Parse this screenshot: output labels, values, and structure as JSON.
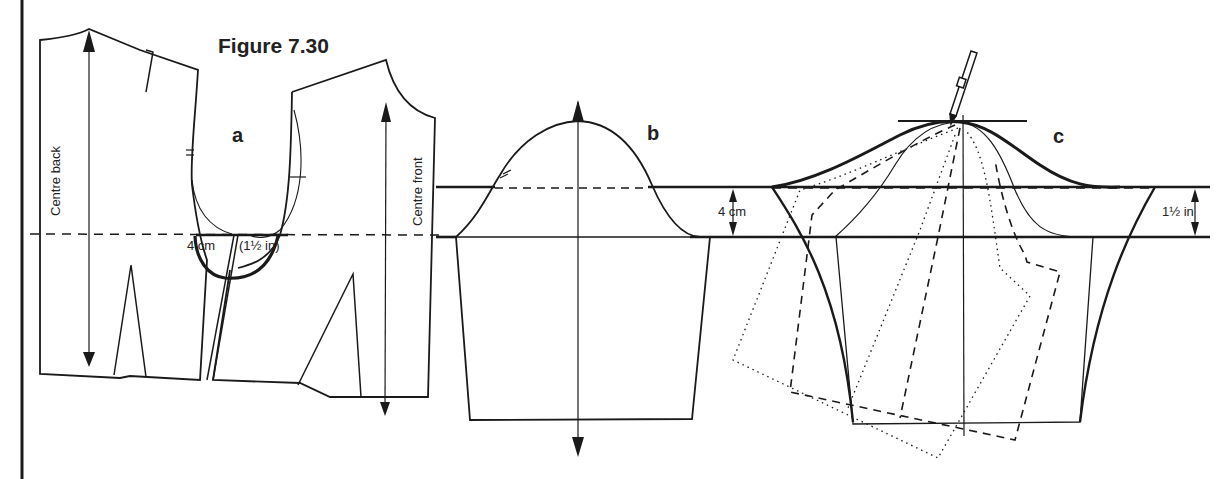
{
  "figure": {
    "title": "Figure 7.30",
    "panels": [
      {
        "id": "a",
        "label": "a",
        "description": "Back and front bodice with armhole lowered"
      },
      {
        "id": "b",
        "label": "b",
        "description": "Sleeve with crown raised"
      },
      {
        "id": "c",
        "label": "c",
        "description": "Sleeve slashed and spread, new crown drawn"
      }
    ]
  },
  "labels": {
    "centre_back": "Centre back",
    "centre_front": "Centre front",
    "armhole_lowering_cm": "4 cm",
    "armhole_lowering_in": "(1½ in)",
    "sleeve_b_measure": "4 cm",
    "sleeve_c_measure": "1½ in"
  },
  "colors": {
    "line": "#1a1a1a",
    "background": "#ffffff"
  },
  "icons": {
    "pencil": "pencil-icon"
  }
}
